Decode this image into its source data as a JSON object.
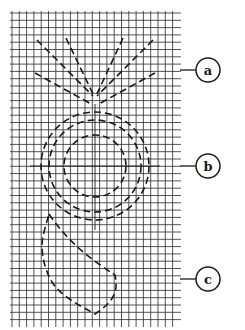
{
  "diagram": {
    "grid": {
      "x0": 12,
      "y0": 13,
      "x1": 179,
      "y1": 325,
      "spacing": 7.3,
      "color": "#2a2a2a"
    },
    "labels": [
      {
        "id": "a",
        "text": "a",
        "cx": 208,
        "cy": 70,
        "r": 12,
        "leader_from": 180,
        "leader_to": 196,
        "target": "radiating-dashed-lines"
      },
      {
        "id": "b",
        "text": "b",
        "cx": 208,
        "cy": 166,
        "r": 12,
        "leader_from": 180,
        "leader_to": 196,
        "target": "concentric-dashed-circles"
      },
      {
        "id": "c",
        "text": "c",
        "cx": 208,
        "cy": 279,
        "r": 12,
        "leader_from": 180,
        "leader_to": 196,
        "target": "teardrop-dashed-shape"
      }
    ],
    "rays": {
      "apex": [
        95,
        98
      ],
      "lines": [
        [
          37,
          40,
          93,
          96
        ],
        [
          66,
          38,
          94,
          96
        ],
        [
          123,
          38,
          96,
          96
        ],
        [
          153,
          40,
          97,
          96
        ],
        [
          35,
          73,
          93,
          105
        ],
        [
          155,
          73,
          97,
          105
        ]
      ]
    },
    "circles": {
      "cx": 95,
      "cy": 166,
      "radii": [
        54,
        46,
        31
      ],
      "crosshair": {
        "h": [
          30,
          160
        ],
        "v": [
          104,
          230
        ]
      }
    },
    "teardrop": {
      "path": "M49 214 C 70 245, 95 262, 115 275 C 118 290, 116 300, 95 314 C 78 305, 60 295, 52 282 C 42 265, 40 245, 44 232 C 46 224, 48 218, 49 214 Z"
    }
  }
}
